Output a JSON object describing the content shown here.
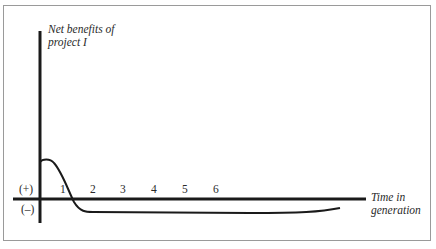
{
  "diagram": {
    "y_axis_label_line1": "Net benefits of",
    "y_axis_label_line2": "project I",
    "x_axis_label_line1": "Time in",
    "x_axis_label_line2": "generation",
    "positive_sign": "(+)",
    "negative_sign": "(–)",
    "ticks": [
      "1",
      "2",
      "3",
      "4",
      "5",
      "6"
    ],
    "curve_description": "Net benefits positive in early period, fall below zero after ~1 generation and remain slightly negative, trending back toward zero"
  },
  "colors": {
    "line": "#1a1a1a",
    "border": "#9a9a9a",
    "text": "#2a2a2a"
  }
}
